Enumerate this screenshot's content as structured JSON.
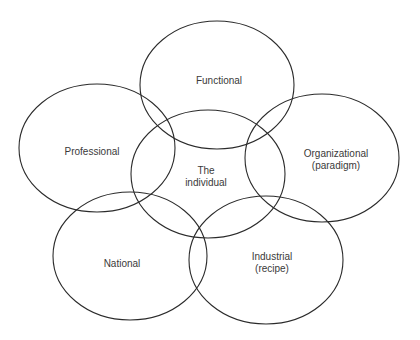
{
  "diagram": {
    "type": "overlapping-ellipses",
    "stroke_color": "#2b2b2b",
    "text_color": "#3a3a3a",
    "background": "#ffffff",
    "nodes": [
      {
        "id": "functional",
        "lines": [
          "Functional"
        ],
        "cx": 217,
        "cy": 85,
        "rx": 77,
        "ry": 64
      },
      {
        "id": "professional",
        "lines": [
          "Professional"
        ],
        "cx": 97,
        "cy": 148,
        "rx": 78,
        "ry": 64
      },
      {
        "id": "organizational",
        "lines": [
          "Organizational",
          "(paradigm)"
        ],
        "cx": 322,
        "cy": 158,
        "rx": 77,
        "ry": 64
      },
      {
        "id": "individual",
        "lines": [
          "The",
          "individual"
        ],
        "cx": 208,
        "cy": 174,
        "rx": 77,
        "ry": 64
      },
      {
        "id": "national",
        "lines": [
          "National"
        ],
        "cx": 130,
        "cy": 256,
        "rx": 77,
        "ry": 64
      },
      {
        "id": "industrial",
        "lines": [
          "Industrial",
          "(recipe)"
        ],
        "cx": 266,
        "cy": 260,
        "rx": 77,
        "ry": 64
      }
    ],
    "labels": {
      "functional": "Functional",
      "professional": "Professional",
      "organizational_1": "Organizational",
      "organizational_2": "(paradigm)",
      "individual_1": "The",
      "individual_2": "individual",
      "national": "National",
      "industrial_1": "Industrial",
      "industrial_2": "(recipe)"
    }
  }
}
